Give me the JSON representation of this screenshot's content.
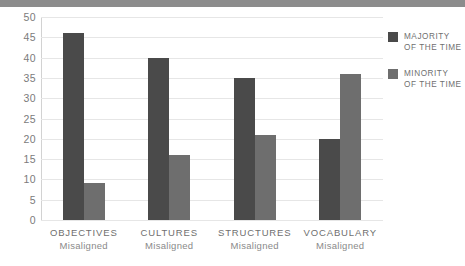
{
  "chart_data": {
    "type": "bar",
    "title": "",
    "xlabel": "",
    "ylabel": "",
    "ylim": [
      0,
      50
    ],
    "ytick_step": 5,
    "grid": true,
    "legend_position": "right",
    "categories": [
      "OBJECTIVES",
      "CULTURES",
      "STRUCTURES",
      "VOCABULARY"
    ],
    "category_sublabels": [
      "Misaligned",
      "Misaligned",
      "Misaligned",
      "Misaligned"
    ],
    "yticks": [
      "50",
      "45",
      "40",
      "35",
      "30",
      "25",
      "20",
      "15",
      "10",
      "5",
      "0"
    ],
    "series": [
      {
        "name": "MAJORITY OF THE TIME",
        "name_line1": "MAJORITY",
        "name_line2": "OF THE TIME",
        "color": "#4a4a4a",
        "values": [
          46,
          40,
          35,
          20
        ]
      },
      {
        "name": "MINORITY OF THE TIME",
        "name_line1": "MINORITY",
        "name_line2": "OF THE TIME",
        "color": "#6e6e6e",
        "values": [
          9,
          16,
          21,
          36
        ]
      }
    ]
  },
  "style": {
    "background": "#ffffff",
    "top_band": "#8c8c8c",
    "gridline": "#e6e6e6",
    "axis": "#cccccc",
    "tick_text": "#7b7b7b",
    "category_text": "#6f6f6f",
    "sublabel_text": "#8a8a8a"
  }
}
